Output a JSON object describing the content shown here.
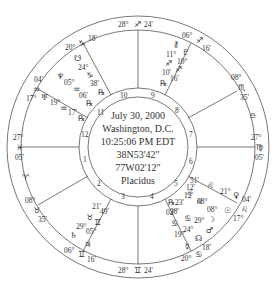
{
  "chart_info": {
    "date": "July 30, 2000",
    "location": "Washington, D.C.",
    "time": "10:25:06 PM EDT",
    "latitude": "38N53'42\"",
    "longitude": "77W02'12\"",
    "house_system": "Placidus"
  },
  "colors": {
    "line": "#555555",
    "text": "#333333",
    "background": "#ffffff"
  },
  "geometry": {
    "cx": 138,
    "cy": 147,
    "r_outer": 131,
    "r_band": 117,
    "r_ring_outer": 59,
    "r_ring_inner": 50
  },
  "house_cusps": [
    {
      "house": 10,
      "label": "MC",
      "deg": "28°",
      "sign": "sagittarius",
      "sign_glyph": "♐",
      "min": "24'",
      "x": 138,
      "y": 10
    },
    {
      "house": 11,
      "deg": "20°",
      "sign": "capricorn",
      "sign_glyph": "♑",
      "min": "18'"
    },
    {
      "house": 12,
      "deg": "17°",
      "sign": "aquarius",
      "sign_glyph": "♒",
      "min": "04'"
    },
    {
      "house": 1,
      "label": "ASC",
      "deg": "27°",
      "sign": "pisces",
      "sign_glyph": "♓",
      "min": "05'"
    },
    {
      "house": 2,
      "deg": "08°",
      "sign": "taurus",
      "sign_glyph": "♉",
      "min": "35'"
    },
    {
      "house": 3,
      "deg": "06°",
      "sign": "gemini",
      "sign_glyph": "♊",
      "min": "16'"
    },
    {
      "house": 4,
      "label": "IC",
      "deg": "28°",
      "sign": "gemini",
      "sign_glyph": "♊",
      "min": "24'"
    },
    {
      "house": 5,
      "deg": "20°",
      "sign": "cancer",
      "sign_glyph": "♋",
      "min": "18'"
    },
    {
      "house": 6,
      "deg": "17°",
      "sign": "leo",
      "sign_glyph": "♌",
      "min": "04'"
    },
    {
      "house": 7,
      "label": "DSC",
      "deg": "27°",
      "sign": "virgo",
      "sign_glyph": "♍",
      "min": "05'"
    },
    {
      "house": 8,
      "deg": "08°",
      "sign": "scorpio",
      "sign_glyph": "♏",
      "min": "35'"
    },
    {
      "house": 9,
      "deg": "06°",
      "sign": "sagittarius",
      "sign_glyph": "♐",
      "min": "16'"
    }
  ],
  "intercepted_signs": [
    {
      "sign": "aries",
      "glyph": "♈"
    },
    {
      "sign": "libra",
      "glyph": "♎"
    }
  ],
  "planets": [
    {
      "name": "Uranus",
      "glyph": "♅",
      "deg": "19°",
      "sign_glyph": "♒",
      "min": "17'",
      "retro": "℞",
      "house": 12
    },
    {
      "name": "Neptune",
      "glyph": "♆",
      "deg": "05°",
      "sign_glyph": "♒",
      "min": "06'",
      "retro": "℞",
      "house": 11
    },
    {
      "name": "South Node",
      "glyph": "☋",
      "deg": "24°",
      "sign_glyph": "♑",
      "min": "38'",
      "retro": "℞",
      "house": 11
    },
    {
      "name": "Pluto",
      "glyph": "♇",
      "deg": "10°",
      "sign_glyph": "♐",
      "min": "16'",
      "retro": "",
      "house": 9
    },
    {
      "name": "Chiron",
      "glyph": "⚷",
      "deg": "11°",
      "sign_glyph": "♐",
      "min": "10'",
      "retro": "℞",
      "house": 9
    },
    {
      "name": "Venus",
      "glyph": "♀",
      "deg": "21°",
      "sign_glyph": "♌",
      "min": "51'",
      "house": 5
    },
    {
      "name": "Sun",
      "glyph": "☉",
      "deg": "08°",
      "sign_glyph": "♌",
      "min": "12'",
      "house": 5
    },
    {
      "name": "Moon",
      "glyph": "☽",
      "deg": "08°",
      "sign_glyph": "♌",
      "min": "12'",
      "house": 5
    },
    {
      "name": "Mars",
      "glyph": "♂",
      "deg": "29°",
      "sign_glyph": "♋",
      "min": "38'",
      "house": 5
    },
    {
      "name": "North Node",
      "glyph": "☊",
      "deg": "24°",
      "sign_glyph": "♋",
      "min": "23'",
      "retro": "℞",
      "house": 5
    },
    {
      "name": "Mercury",
      "glyph": "☿",
      "deg": "19°",
      "sign_glyph": "♋",
      "min": "02'",
      "house": 5
    },
    {
      "name": "Saturn",
      "glyph": "♄",
      "deg": "29°",
      "sign_glyph": "♉",
      "min": "21'",
      "house": 3
    },
    {
      "name": "Jupiter",
      "glyph": "♃",
      "deg": "05°",
      "sign_glyph": "♊",
      "min": "49'",
      "house": 3
    }
  ],
  "house_numbers": [
    "1",
    "2",
    "3",
    "4",
    "5",
    "6",
    "7",
    "8",
    "9",
    "10",
    "11",
    "12"
  ]
}
